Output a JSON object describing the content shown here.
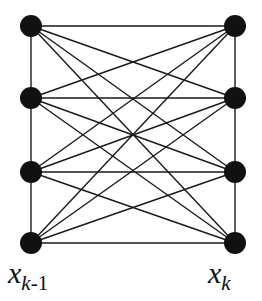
{
  "figure": {
    "title": "",
    "type": "complete-bipartite-graph-k44",
    "background_color": "#ffffff",
    "node_color": "#111111",
    "edge_color": "#1a1a1a",
    "node_radius": 11,
    "edge_width": 1.4
  },
  "labels": {
    "left": {
      "base": "x",
      "sub_main": "k",
      "sub_suffix": "-1",
      "full": "x_k-1"
    },
    "right": {
      "base": "x",
      "sub_main": "k",
      "sub_suffix": "",
      "full": "x_k"
    }
  },
  "graph_data": {
    "type": "bipartite-graph",
    "left_column_label": "x_k-1",
    "right_column_label": "x_k",
    "node_count_left": 4,
    "node_count_right": 4,
    "nodes": [
      {
        "id": "L1",
        "side": "left",
        "row": 1,
        "x": 31,
        "y": 26
      },
      {
        "id": "L2",
        "side": "left",
        "row": 2,
        "x": 31,
        "y": 98
      },
      {
        "id": "L3",
        "side": "left",
        "row": 3,
        "x": 31,
        "y": 172
      },
      {
        "id": "L4",
        "side": "left",
        "row": 4,
        "x": 31,
        "y": 243
      },
      {
        "id": "R1",
        "side": "right",
        "row": 1,
        "x": 235,
        "y": 26
      },
      {
        "id": "R2",
        "side": "right",
        "row": 2,
        "x": 235,
        "y": 98
      },
      {
        "id": "R3",
        "side": "right",
        "row": 3,
        "x": 235,
        "y": 172
      },
      {
        "id": "R4",
        "side": "right",
        "row": 4,
        "x": 235,
        "y": 243
      }
    ],
    "cross_edges": [
      [
        "L1",
        "R1"
      ],
      [
        "L1",
        "R2"
      ],
      [
        "L1",
        "R3"
      ],
      [
        "L1",
        "R4"
      ],
      [
        "L2",
        "R1"
      ],
      [
        "L2",
        "R2"
      ],
      [
        "L2",
        "R3"
      ],
      [
        "L2",
        "R4"
      ],
      [
        "L3",
        "R1"
      ],
      [
        "L3",
        "R2"
      ],
      [
        "L3",
        "R3"
      ],
      [
        "L3",
        "R4"
      ],
      [
        "L4",
        "R1"
      ],
      [
        "L4",
        "R2"
      ],
      [
        "L4",
        "R3"
      ],
      [
        "L4",
        "R4"
      ]
    ],
    "vertical_edges": [
      [
        "L1",
        "L2"
      ],
      [
        "L2",
        "L3"
      ],
      [
        "L3",
        "L4"
      ],
      [
        "R1",
        "R2"
      ],
      [
        "R2",
        "R3"
      ],
      [
        "R3",
        "R4"
      ]
    ],
    "cross_edge_count": 16,
    "vertical_edge_count": 6
  }
}
